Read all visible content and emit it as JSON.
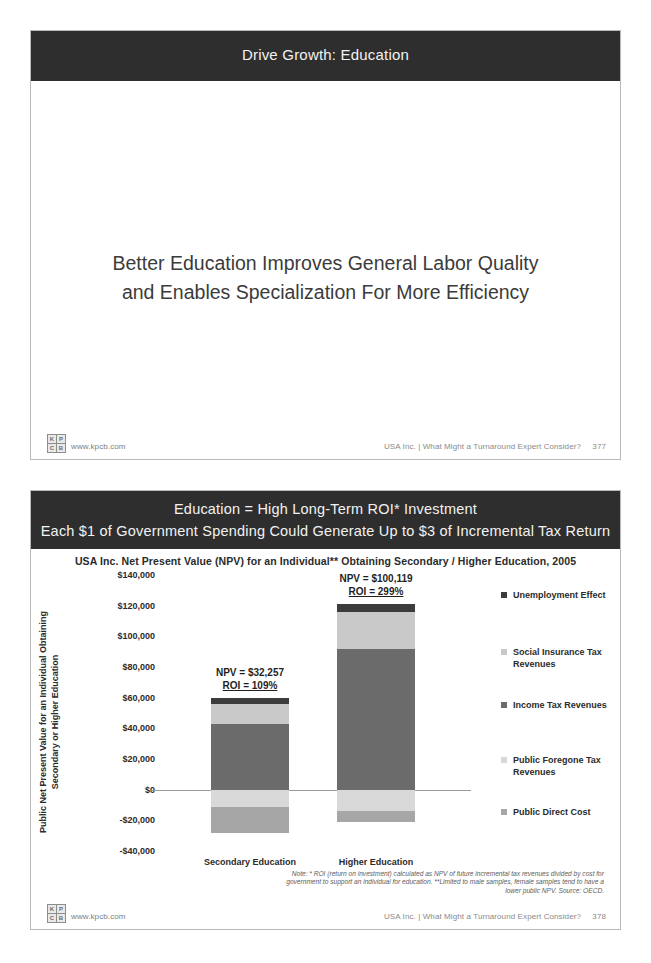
{
  "slide1": {
    "header_title": "Drive Growth: Education",
    "statement_line1": "Better Education Improves General Labor Quality",
    "statement_line2": "and Enables Specialization For More Efficiency",
    "footer": {
      "url": "www.kpcb.com",
      "deck_title": "USA Inc. | What Might a Turnaround Expert Consider?",
      "page_number": "377",
      "logo_letters": [
        "K",
        "P",
        "C",
        "B"
      ]
    }
  },
  "slide2": {
    "header_line1": "Education = High Long-Term ROI* Investment",
    "header_line2": "Each $1 of Government Spending Could Generate Up to $3 of Incremental Tax Return",
    "footer": {
      "url": "www.kpcb.com",
      "deck_title": "USA Inc. | What Might a Turnaround Expert Consider?",
      "page_number": "378",
      "logo_letters": [
        "K",
        "P",
        "C",
        "B"
      ]
    },
    "footnote_line1": "Note: * ROI (return on investment) calculated as NPV of future incremental tax revenues divided by cost for",
    "footnote_line2": "government to support an individual for education. **Limited to male samples, female samples tend to have a",
    "footnote_line3": "lower public NPV. Source: OECD.",
    "y_axis_title_line1": "Public Net Present Value for an Individual Obtaining",
    "y_axis_title_line2": "Secondary or Higher Education"
  },
  "chart_data": {
    "type": "bar",
    "subtype": "stacked-bar-with-negatives",
    "title": "USA Inc. Net Present Value (NPV) for an Individual** Obtaining Secondary / Higher Education, 2005",
    "xlabel": "",
    "ylabel": "Public Net Present Value for an Individual Obtaining Secondary or Higher Education",
    "ylim": [
      -40000,
      140000
    ],
    "ytick_step": 20000,
    "ytick_labels": [
      "$140,000",
      "$120,000",
      "$100,000",
      "$80,000",
      "$60,000",
      "$40,000",
      "$20,000",
      "$0",
      "-$20,000",
      "-$40,000"
    ],
    "ytick_values": [
      140000,
      120000,
      100000,
      80000,
      60000,
      40000,
      20000,
      0,
      -20000,
      -40000
    ],
    "grid": false,
    "legend_position": "right",
    "categories": [
      "Secondary Education",
      "Higher Education"
    ],
    "series": [
      {
        "name": "Unemployment Effect",
        "color": "#3c3c3c",
        "values": [
          4000,
          5000
        ]
      },
      {
        "name": "Social Insurance Tax Revenues",
        "color": "#c9c9c9",
        "values": [
          13000,
          24000
        ]
      },
      {
        "name": "Income Tax Revenues",
        "color": "#6b6b6b",
        "values": [
          43000,
          92000
        ]
      },
      {
        "name": "Public Foregone Tax Revenues",
        "color": "#d9d9d9",
        "values": [
          -11000,
          -14000
        ]
      },
      {
        "name": "Public Direct Cost",
        "color": "#a6a6a6",
        "values": [
          -17000,
          -7000
        ]
      }
    ],
    "annotations": [
      {
        "category": "Secondary Education",
        "npv_label": "NPV = $32,257",
        "roi_label": "ROI = 109%",
        "npv": 32257,
        "roi_pct": 109
      },
      {
        "category": "Higher Education",
        "npv_label": "NPV = $100,119",
        "roi_label": "ROI = 299%",
        "npv": 100119,
        "roi_pct": 299
      }
    ]
  }
}
